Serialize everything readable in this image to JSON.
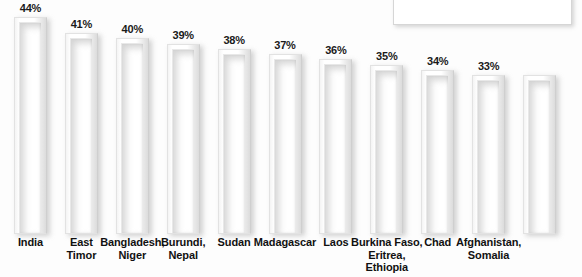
{
  "chart_data": {
    "type": "bar",
    "title": "",
    "xlabel": "",
    "ylabel": "",
    "ylim": [
      0,
      44
    ],
    "grid": false,
    "legend_position": "top-right",
    "categories": [
      "India",
      "East Timor",
      "Bangladesh, Niger",
      "Burundi, Nepal",
      "Sudan",
      "Madagascar",
      "Laos",
      "Burkina Faso, Eritrea, Ethiopia",
      "Chad",
      "Afghanistan, Somalia"
    ],
    "values": [
      44,
      41,
      40,
      39,
      38,
      37,
      36,
      35,
      34,
      33
    ],
    "value_labels": [
      "44%",
      "41%",
      "40%",
      "39%",
      "38%",
      "37%",
      "36%",
      "35%",
      "34%",
      "33%"
    ],
    "bars": [
      {
        "label_lines": [
          "India"
        ],
        "value": 44,
        "value_label": "44%"
      },
      {
        "label_lines": [
          "East",
          "Timor"
        ],
        "value": 41,
        "value_label": "41%"
      },
      {
        "label_lines": [
          "Bangladesh,",
          "Niger"
        ],
        "value": 40,
        "value_label": "40%"
      },
      {
        "label_lines": [
          "Burundi,",
          "Nepal"
        ],
        "value": 39,
        "value_label": "39%"
      },
      {
        "label_lines": [
          "Sudan"
        ],
        "value": 38,
        "value_label": "38%"
      },
      {
        "label_lines": [
          "Madagascar"
        ],
        "value": 37,
        "value_label": "37%"
      },
      {
        "label_lines": [
          "Laos"
        ],
        "value": 36,
        "value_label": "36%"
      },
      {
        "label_lines": [
          "Burkina Faso,",
          "Eritrea,",
          "Ethiopia"
        ],
        "value": 35,
        "value_label": "35%"
      },
      {
        "label_lines": [
          "Chad"
        ],
        "value": 34,
        "value_label": "34%"
      },
      {
        "label_lines": [
          "Afghanistan,",
          "Somalia"
        ],
        "value": 33,
        "value_label": "33%"
      }
    ],
    "bar_count_drawn": 11,
    "colors": {
      "bar_fill": "#ffffff",
      "bar_border": "#e2e2e2",
      "value_text": "#1a1a1a",
      "category_text": "#111111",
      "background": "#fdfdfd",
      "legend_box_border": "#d6d6d6"
    }
  },
  "legend": {
    "text": ""
  },
  "title_sliver": {
    "text": ""
  }
}
